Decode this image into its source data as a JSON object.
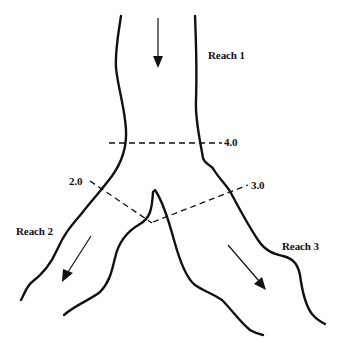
{
  "diagram": {
    "type": "river-junction-schematic",
    "reaches": [
      {
        "id": "reach-1",
        "label": "Reach 1",
        "flow_direction": "down"
      },
      {
        "id": "reach-2",
        "label": "Reach 2",
        "flow_direction": "down-left"
      },
      {
        "id": "reach-3",
        "label": "Reach 3",
        "flow_direction": "down-right"
      }
    ],
    "cross_sections": [
      {
        "id": "xs-4",
        "label": "4.0"
      },
      {
        "id": "xs-2",
        "label": "2.0"
      },
      {
        "id": "xs-3",
        "label": "3.0"
      }
    ],
    "colors": {
      "line": "#111111",
      "background": "#ffffff"
    }
  }
}
